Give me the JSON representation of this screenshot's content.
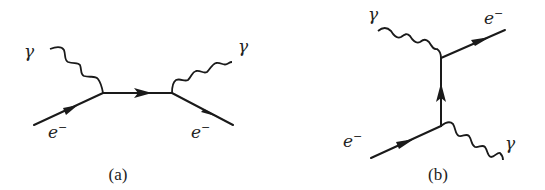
{
  "figure": {
    "panels": [
      {
        "id": "a",
        "caption": "(a)",
        "description": "s-channel Compton scattering",
        "labels": {
          "photon_in": "γ",
          "photon_out": "γ",
          "electron_in": "e",
          "electron_in_sup": "−",
          "electron_out": "e",
          "electron_out_sup": "−"
        }
      },
      {
        "id": "b",
        "caption": "(b)",
        "description": "u-channel Compton scattering",
        "labels": {
          "photon_in": "γ",
          "photon_out": "γ",
          "electron_in": "e",
          "electron_in_sup": "−",
          "electron_out": "e",
          "electron_out_sup": "−"
        }
      }
    ],
    "colors": {
      "ink": "#1a1a1a",
      "background": "#ffffff"
    }
  }
}
